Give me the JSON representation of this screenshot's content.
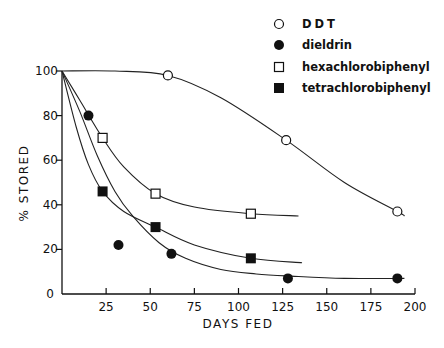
{
  "chart_data": {
    "type": "line",
    "title": "",
    "xlabel": "DAYS FED",
    "ylabel": "% STORED",
    "xlim": [
      0,
      200
    ],
    "ylim": [
      0,
      100
    ],
    "xticks": [
      25,
      50,
      75,
      100,
      125,
      150,
      175,
      200
    ],
    "xtick_labels": [
      "25",
      "50",
      "75",
      "100",
      "125",
      "150",
      "175",
      "200"
    ],
    "yticks": [
      0,
      20,
      40,
      60,
      80,
      100
    ],
    "ytick_labels": [
      "0",
      "20",
      "40",
      "60",
      "80",
      "100"
    ],
    "grid": false,
    "legend_position": "upper right",
    "series": [
      {
        "name": "DDT",
        "marker": "open-circle",
        "points": [
          [
            60,
            98
          ],
          [
            127,
            69
          ],
          [
            190,
            37
          ]
        ],
        "curve": [
          [
            0,
            100
          ],
          [
            30,
            100
          ],
          [
            60,
            98
          ],
          [
            90,
            88
          ],
          [
            127,
            69
          ],
          [
            160,
            50
          ],
          [
            190,
            37
          ],
          [
            194,
            35
          ]
        ]
      },
      {
        "name": "dieldrin",
        "marker": "filled-circle",
        "points": [
          [
            15,
            80
          ],
          [
            32,
            22
          ],
          [
            62,
            18
          ],
          [
            128,
            7
          ],
          [
            190,
            7
          ]
        ],
        "curve": [
          [
            0,
            100
          ],
          [
            10,
            82
          ],
          [
            20,
            62
          ],
          [
            30,
            46
          ],
          [
            40,
            35
          ],
          [
            55,
            23
          ],
          [
            70,
            16
          ],
          [
            90,
            11
          ],
          [
            110,
            9
          ],
          [
            130,
            8
          ],
          [
            160,
            7
          ],
          [
            194,
            7
          ]
        ]
      },
      {
        "name": "hexachlorobiphenyl",
        "marker": "open-square",
        "points": [
          [
            23,
            70
          ],
          [
            53,
            45
          ],
          [
            107,
            36
          ]
        ],
        "curve": [
          [
            0,
            100
          ],
          [
            10,
            87
          ],
          [
            23,
            70
          ],
          [
            35,
            57
          ],
          [
            53,
            45
          ],
          [
            75,
            39
          ],
          [
            107,
            36
          ],
          [
            134,
            35
          ]
        ]
      },
      {
        "name": "tetrachlorobiphenyl",
        "marker": "filled-square",
        "points": [
          [
            23,
            46
          ],
          [
            53,
            30
          ],
          [
            107,
            16
          ]
        ],
        "curve": [
          [
            0,
            100
          ],
          [
            8,
            75
          ],
          [
            15,
            58
          ],
          [
            23,
            46
          ],
          [
            35,
            37
          ],
          [
            53,
            30
          ],
          [
            75,
            22
          ],
          [
            107,
            16
          ],
          [
            136,
            14
          ]
        ]
      }
    ]
  },
  "legend": {
    "items": [
      {
        "label": "DDT",
        "marker": "open-circle"
      },
      {
        "label": "dieldrin",
        "marker": "filled-circle"
      },
      {
        "label": "hexachlorobiphenyl",
        "marker": "open-square"
      },
      {
        "label": "tetrachlorobiphenyl",
        "marker": "filled-square"
      }
    ]
  }
}
